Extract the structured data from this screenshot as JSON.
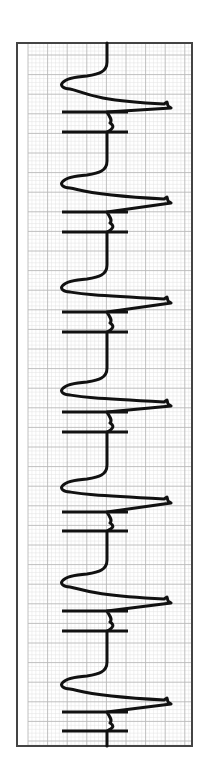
{
  "chart_data": {
    "type": "line",
    "title": "",
    "subtitle": "Paced ECG rhythm strip (rotated 90°, time runs top to bottom)",
    "xlabel": "",
    "ylabel": "",
    "grid": true,
    "legend": null,
    "orientation": "vertical",
    "frame": {
      "x": 17,
      "y": 43,
      "width": 175,
      "height": 703,
      "color": "#444444"
    },
    "grid_spec": {
      "x0": 28,
      "y0": 55,
      "major": 19.6,
      "minor": 3.92,
      "major_color": "#b9b9b9",
      "minor_color": "#e2e2e2"
    },
    "baseline_x": 107,
    "trace_color": "#111111",
    "beats": [
      {
        "index": 1,
        "q_dip_y": 84,
        "r_peak_y": 107,
        "spike_ys": [
          112,
          132
        ]
      },
      {
        "index": 2,
        "q_dip_y": 183,
        "r_peak_y": 202,
        "spike_ys": [
          212,
          232
        ]
      },
      {
        "index": 3,
        "q_dip_y": 287,
        "r_peak_y": 302,
        "spike_ys": [
          312,
          332
        ]
      },
      {
        "index": 4,
        "q_dip_y": 390,
        "r_peak_y": 405,
        "spike_ys": [
          412,
          432
        ]
      },
      {
        "index": 5,
        "q_dip_y": 487,
        "r_peak_y": 502,
        "spike_ys": [
          512,
          531
        ]
      },
      {
        "index": 6,
        "q_dip_y": 582,
        "r_peak_y": 602,
        "spike_ys": [
          611,
          631
        ]
      },
      {
        "index": 7,
        "q_dip_y": 684,
        "r_peak_y": 703,
        "spike_ys": [
          712,
          731
        ]
      }
    ],
    "amplitudes": {
      "q_dip_x": 62,
      "r_peak_x": 170,
      "spike_left_x": 62,
      "spike_right_x": 128
    },
    "beat_count": 7,
    "mean_rr_px": 99.3
  }
}
